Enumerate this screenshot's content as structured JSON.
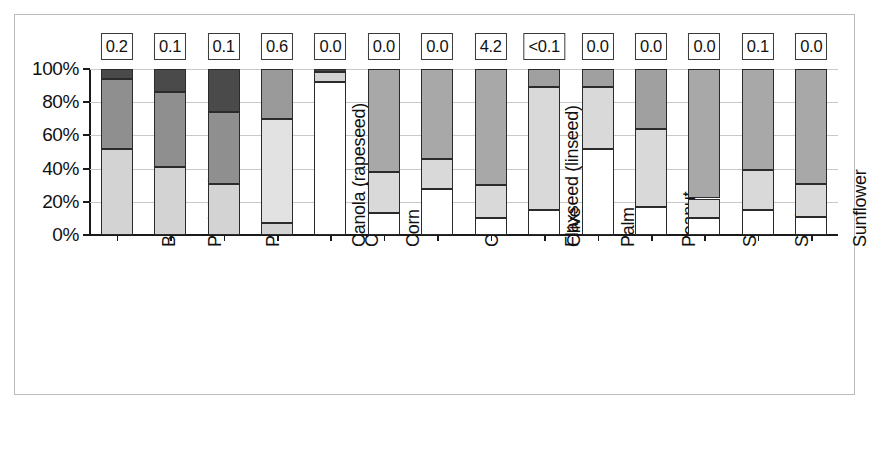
{
  "chart_data": {
    "type": "bar",
    "title": "",
    "subtitle": "",
    "xlabel": "",
    "ylabel": "",
    "ylim": [
      0,
      100
    ],
    "ytick_labels": [
      "0%",
      "20%",
      "40%",
      "60%",
      "80%",
      "100%"
    ],
    "ytick_values": [
      0,
      20,
      40,
      60,
      80,
      100
    ],
    "grid": true,
    "legend_position": "none",
    "stacked": true,
    "stack_total": 100,
    "categories": [
      "Beef tallow",
      "Pork lard",
      "Poultry fat",
      "Canola (rapeseed)",
      "Coconut",
      "Corn",
      "Cottonseed",
      "Flaxseed (linseed)",
      "Olive",
      "Palm",
      "Peanut",
      "Safflower",
      "Soybean",
      "Sunflower"
    ],
    "series": [
      {
        "name": "saturated",
        "color": "#d0d0d0",
        "values": [
          52,
          41,
          31,
          7,
          92,
          13,
          28,
          10,
          15,
          52,
          17,
          10,
          15,
          11
        ]
      },
      {
        "name": "monounsaturated",
        "color": "#b3b3b3",
        "values": [
          42,
          45,
          43,
          63,
          6,
          25,
          18,
          20,
          74,
          37,
          47,
          12,
          24,
          20
        ]
      },
      {
        "name": "polyunsaturated",
        "color": "#8f8f8f",
        "values": [
          6,
          14,
          26,
          30,
          2,
          62,
          54,
          70,
          11,
          11,
          36,
          78,
          61,
          69
        ]
      }
    ],
    "segment_colors": [
      [
        "#d3d3d3",
        "#8f8f8f",
        "#4a4a4a"
      ],
      [
        "#d3d3d3",
        "#8f8f8f",
        "#4a4a4a"
      ],
      [
        "#d3d3d3",
        "#8f8f8f",
        "#4a4a4a"
      ],
      [
        "#d3d3d3",
        "#e2e2e2",
        "#9a9a9a"
      ],
      [
        "#ffffff",
        "#d3d3d3",
        "#4a4a4a"
      ],
      [
        "#ffffff",
        "#d9d9d9",
        "#a8a8a8"
      ],
      [
        "#ffffff",
        "#d9d9d9",
        "#a8a8a8"
      ],
      [
        "#ffffff",
        "#d9d9d9",
        "#a8a8a8"
      ],
      [
        "#ffffff",
        "#d9d9d9",
        "#a0a0a0"
      ],
      [
        "#ffffff",
        "#d9d9d9",
        "#a0a0a0"
      ],
      [
        "#ffffff",
        "#d9d9d9",
        "#a0a0a0"
      ],
      [
        "#ffffff",
        "#d9d9d9",
        "#a8a8a8"
      ],
      [
        "#ffffff",
        "#d9d9d9",
        "#a8a8a8"
      ],
      [
        "#ffffff",
        "#d9d9d9",
        "#a8a8a8"
      ]
    ],
    "top_value_labels": [
      "0.2",
      "0.1",
      "0.1",
      "0.6",
      "0.0",
      "0.0",
      "0.0",
      "4.2",
      "<0.1",
      "0.0",
      "0.0",
      "0.0",
      "0.1",
      "0.0"
    ]
  }
}
